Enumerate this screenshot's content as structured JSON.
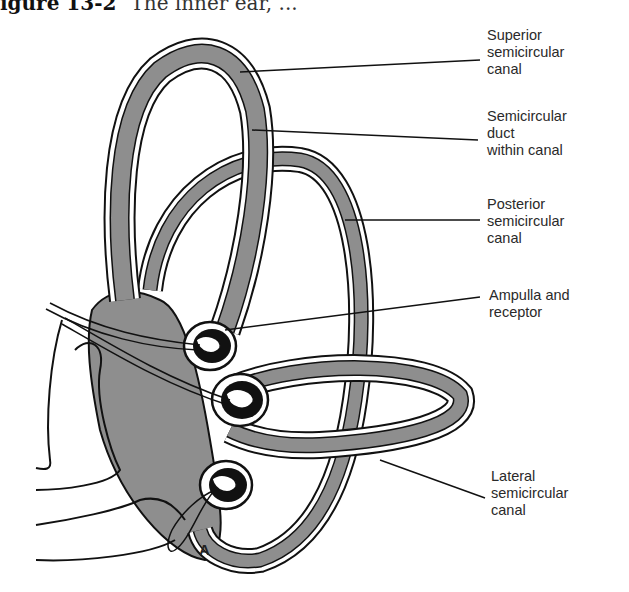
{
  "caption": {
    "figure_number": "igure 13-2",
    "text": "The inner ear, ..."
  },
  "panel_letter": "A",
  "colors": {
    "fill_gray": "#8e8e8e",
    "outline": "#111111",
    "endolymph_dark": "#111111",
    "background": "#ffffff"
  },
  "labels": [
    {
      "id": "superior",
      "lines": [
        "Superior",
        "semicircular",
        "canal"
      ]
    },
    {
      "id": "duct",
      "lines": [
        "Semicircular",
        "duct",
        "within canal"
      ]
    },
    {
      "id": "posterior",
      "lines": [
        "Posterior",
        "semicircular",
        "canal"
      ]
    },
    {
      "id": "ampulla",
      "lines": [
        "Ampulla and",
        "receptor"
      ]
    },
    {
      "id": "lateral",
      "lines": [
        "Lateral",
        "semicircular",
        "canal"
      ]
    }
  ]
}
